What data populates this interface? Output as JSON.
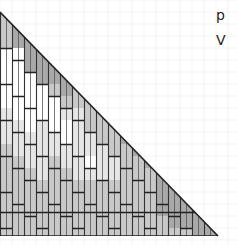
{
  "diagram": {
    "side_labels": [
      "p",
      "V"
    ],
    "shade_colors": {
      "0": "#ffffff",
      "1": "#e6e6e6",
      "2": "#c9c9c9",
      "3": "#a9a9a9"
    },
    "rows": 19,
    "cols": 18,
    "shade_map": [
      [
        2,
        0,
        0,
        0,
        0,
        0,
        0,
        0,
        0,
        0,
        0,
        0,
        0,
        0,
        0,
        0,
        0,
        0
      ],
      [
        2,
        3,
        0,
        0,
        0,
        0,
        0,
        0,
        0,
        0,
        0,
        0,
        0,
        0,
        0,
        0,
        0,
        0
      ],
      [
        2,
        3,
        3,
        0,
        0,
        0,
        0,
        0,
        0,
        0,
        0,
        0,
        0,
        0,
        0,
        0,
        0,
        0
      ],
      [
        0,
        0,
        3,
        3,
        0,
        0,
        0,
        0,
        0,
        0,
        0,
        0,
        0,
        0,
        0,
        0,
        0,
        0
      ],
      [
        0,
        0,
        3,
        3,
        3,
        0,
        0,
        0,
        0,
        0,
        0,
        0,
        0,
        0,
        0,
        0,
        0,
        0
      ],
      [
        0,
        0,
        0,
        3,
        3,
        3,
        0,
        0,
        0,
        0,
        0,
        0,
        0,
        0,
        0,
        0,
        0,
        0
      ],
      [
        0,
        0,
        0,
        0,
        2,
        3,
        2,
        0,
        0,
        0,
        0,
        0,
        0,
        0,
        0,
        0,
        0,
        0
      ],
      [
        0,
        0,
        0,
        0,
        0,
        2,
        2,
        2,
        0,
        0,
        0,
        0,
        0,
        0,
        0,
        0,
        0,
        0
      ],
      [
        1,
        0,
        0,
        0,
        0,
        1,
        1,
        2,
        2,
        0,
        0,
        0,
        0,
        0,
        0,
        0,
        0,
        0
      ],
      [
        1,
        1,
        0,
        1,
        0,
        0,
        1,
        2,
        2,
        2,
        0,
        0,
        0,
        0,
        0,
        0,
        0,
        0
      ],
      [
        1,
        1,
        1,
        1,
        1,
        0,
        1,
        1,
        2,
        2,
        3,
        0,
        0,
        0,
        0,
        0,
        0,
        0
      ],
      [
        2,
        1,
        1,
        1,
        1,
        1,
        1,
        1,
        1,
        2,
        2,
        3,
        0,
        0,
        0,
        0,
        0,
        0
      ],
      [
        2,
        2,
        1,
        1,
        2,
        1,
        1,
        0,
        1,
        1,
        2,
        2,
        3,
        0,
        0,
        0,
        0,
        0
      ],
      [
        2,
        2,
        2,
        1,
        2,
        2,
        1,
        1,
        1,
        1,
        2,
        2,
        2,
        3,
        0,
        0,
        0,
        0
      ],
      [
        2,
        2,
        2,
        2,
        2,
        2,
        2,
        2,
        2,
        2,
        2,
        2,
        2,
        3,
        3,
        0,
        0,
        0
      ],
      [
        2,
        2,
        2,
        2,
        2,
        2,
        2,
        2,
        2,
        2,
        2,
        2,
        2,
        3,
        3,
        3,
        0,
        0
      ],
      [
        2,
        2,
        2,
        2,
        2,
        2,
        2,
        2,
        2,
        2,
        2,
        2,
        2,
        3,
        3,
        3,
        3,
        0
      ],
      [
        2,
        2,
        2,
        2,
        2,
        2,
        2,
        2,
        2,
        2,
        2,
        2,
        2,
        2,
        3,
        3,
        3,
        3
      ],
      [
        2,
        2,
        2,
        2,
        2,
        2,
        2,
        2,
        2,
        2,
        2,
        2,
        2,
        2,
        2,
        2,
        3,
        3
      ]
    ]
  }
}
